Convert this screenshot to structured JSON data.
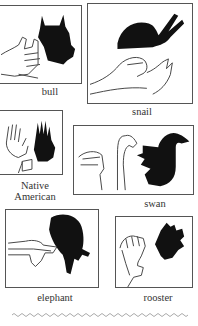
{
  "figures": [
    {
      "id": "bull",
      "caption": "bull"
    },
    {
      "id": "snail",
      "caption": "snail"
    },
    {
      "id": "native-american",
      "caption": "Native American",
      "caption_lines": [
        "Native",
        "American"
      ]
    },
    {
      "id": "swan",
      "caption": "swan"
    },
    {
      "id": "elephant",
      "caption": "elephant"
    },
    {
      "id": "rooster",
      "caption": "rooster"
    }
  ],
  "colors": {
    "shadow": "#111111",
    "line": "#444444",
    "border": "#555555"
  }
}
